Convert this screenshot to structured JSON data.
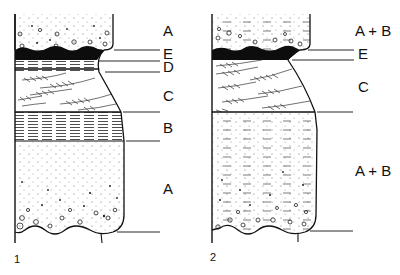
{
  "figure": {
    "colors": {
      "ink": "#111111",
      "paper": "#ffffff",
      "soil_band": "#0d0d0d"
    },
    "profiles": [
      {
        "number": "1",
        "layers": [
          {
            "label": "A",
            "description": "gravelly sand cap"
          },
          {
            "label": "E",
            "description": "dark band"
          },
          {
            "label": "D",
            "description": "fine horizontal lamination"
          },
          {
            "label": "C",
            "description": "cross-bedded sand"
          },
          {
            "label": "B",
            "description": "horizontal lamination"
          },
          {
            "label": "A",
            "description": "graded sand with gravel"
          }
        ]
      },
      {
        "number": "2",
        "layers": [
          {
            "label": "A + B",
            "description": "mixed gravelly sand cap"
          },
          {
            "label": "E",
            "description": "dark band"
          },
          {
            "label": "C",
            "description": "cross-bedded sand"
          },
          {
            "label": "A + B",
            "description": "mixed sand with gravel"
          }
        ]
      }
    ]
  }
}
